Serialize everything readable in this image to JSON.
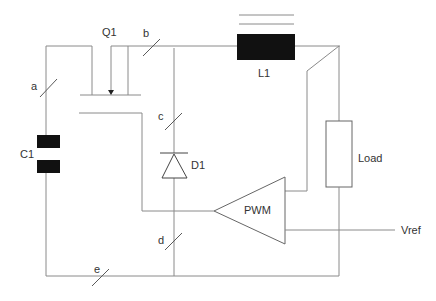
{
  "diagram": {
    "type": "buck-converter-schematic",
    "components": {
      "q1": {
        "label": "Q1",
        "kind": "transistor"
      },
      "l1": {
        "label": "L1",
        "kind": "inductor"
      },
      "c1": {
        "label": "C1",
        "kind": "capacitor"
      },
      "d1": {
        "label": "D1",
        "kind": "diode"
      },
      "load": {
        "label": "Load",
        "kind": "resistor"
      },
      "pwm": {
        "label": "PWM",
        "kind": "comparator"
      },
      "vref": {
        "label": "Vref",
        "kind": "reference-input"
      }
    },
    "branches": {
      "a": "a",
      "b": "b",
      "c": "c",
      "d": "d",
      "e": "e"
    },
    "colors": {
      "wire": "#8a8a8a",
      "component_fill": "#111111",
      "text": "#333333"
    }
  }
}
